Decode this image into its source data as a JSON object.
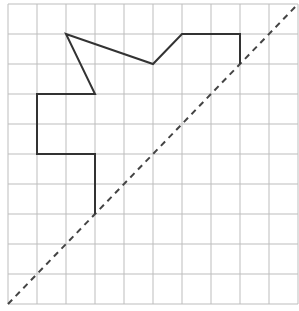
{
  "diagram": {
    "type": "grid-figure-with-symmetry-axis",
    "grid": {
      "columns": 10,
      "rows": 10,
      "origin_px": [
        8,
        4
      ],
      "cell_width_px": 29,
      "cell_height_px": 30,
      "line_color": "#bdbdbd"
    },
    "figure": {
      "description": "Half of a figure drawn on the grid; both ends touch the dashed diagonal axis",
      "stroke_color": "#333333",
      "vertices_grid": [
        [
          3,
          7
        ],
        [
          3,
          5
        ],
        [
          1,
          5
        ],
        [
          1,
          3
        ],
        [
          3,
          3
        ],
        [
          2,
          1
        ],
        [
          5,
          2
        ],
        [
          6,
          1
        ],
        [
          8,
          1
        ],
        [
          8,
          2
        ]
      ]
    },
    "axis": {
      "style": "dashed",
      "color": "#444444",
      "from_grid": [
        0,
        10
      ],
      "to_grid": [
        10,
        0
      ]
    }
  }
}
